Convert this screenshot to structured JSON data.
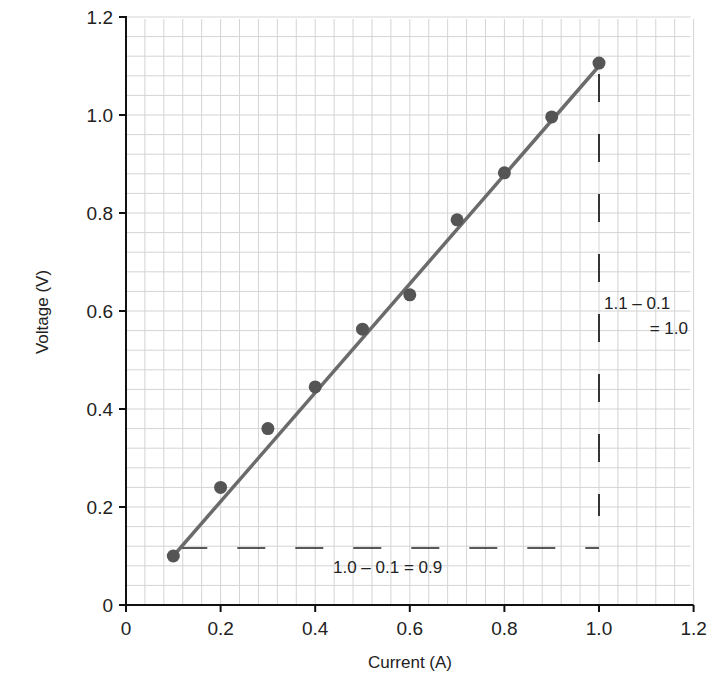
{
  "chart_data": {
    "type": "scatter",
    "title": "",
    "xlabel": "Current (A)",
    "ylabel": "Voltage (V)",
    "xlim": [
      0,
      1.2
    ],
    "ylim": [
      0,
      1.2
    ],
    "grid": true,
    "x_ticks": [
      "0",
      "0.2",
      "0.4",
      "0.6",
      "0.8",
      "1.0",
      "1.2"
    ],
    "y_ticks": [
      "0",
      "0.2",
      "0.4",
      "0.6",
      "0.8",
      "1.0",
      "1.2"
    ],
    "series": [
      {
        "name": "measurements",
        "x": [
          0.1,
          0.2,
          0.3,
          0.4,
          0.5,
          0.6,
          0.7,
          0.8,
          0.9,
          1.0
        ],
        "y": [
          0.1,
          0.24,
          0.36,
          0.445,
          0.563,
          0.633,
          0.786,
          0.882,
          0.996,
          1.106
        ]
      }
    ],
    "fit_line": {
      "x0": 0.1,
      "y0": 0.1,
      "x1": 1.0,
      "y1": 1.1
    },
    "annotations": [
      {
        "text": "1.0 – 0.1 = 0.9",
        "type": "horizontal-run"
      },
      {
        "text_line1": "1.1 – 0.1",
        "text_line2": "= 1.0",
        "type": "vertical-rise"
      }
    ]
  }
}
